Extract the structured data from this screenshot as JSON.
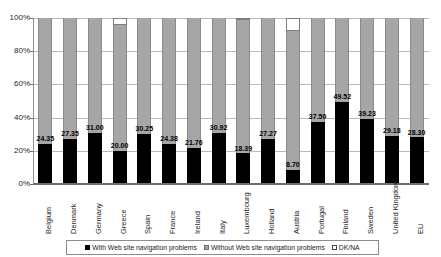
{
  "title_sliver": "",
  "chart_data": {
    "type": "bar",
    "subtype": "stacked-100-percent",
    "title": "",
    "xlabel": "",
    "ylabel": "",
    "ylim": [
      0,
      100
    ],
    "ytick_labels": [
      "100%",
      "80%",
      "60%",
      "40%",
      "20%",
      "0%"
    ],
    "ytick_values": [
      100,
      80,
      60,
      40,
      20,
      0
    ],
    "grid": true,
    "legend_position": "bottom",
    "categories": [
      "Belgium",
      "Denmark",
      "Germany",
      "Greece",
      "Spain",
      "France",
      "Ireland",
      "Italy",
      "Luxembourg",
      "Holland",
      "Austria",
      "Portugal",
      "Finland",
      "Sweden",
      "United Kingdom",
      "EU"
    ],
    "series": [
      {
        "name": "With Web site navigation problems",
        "color": "#000000",
        "values": [
          24.35,
          27.35,
          31.0,
          20.0,
          30.25,
          24.38,
          21.76,
          30.92,
          18.39,
          27.27,
          8.7,
          37.5,
          49.52,
          39.23,
          29.18,
          28.3
        ],
        "labels": [
          "24.35",
          "27.35",
          "31.00",
          "20.00",
          "30.25",
          "24.38",
          "21.76",
          "30.92",
          "18.39",
          "27.27",
          "8.70",
          "37.50",
          "49.52",
          "39.23",
          "29.18",
          "28.30"
        ]
      },
      {
        "name": "Without Web site navigation problems",
        "color": "#a6a6a6",
        "values": [
          75.65,
          72.65,
          69.0,
          76.0,
          69.75,
          75.62,
          78.24,
          69.08,
          80.61,
          72.73,
          83.3,
          62.5,
          50.48,
          60.77,
          70.82,
          71.7
        ]
      },
      {
        "name": "DK/NA",
        "color": "#ffffff",
        "values": [
          0,
          0,
          0,
          4.0,
          0,
          0,
          0,
          0,
          1.0,
          0,
          8.0,
          0,
          0,
          0,
          0,
          0
        ]
      }
    ],
    "legend": [
      "With Web site navigation problems",
      "Without Web site navigation problems",
      "DK/NA"
    ]
  }
}
